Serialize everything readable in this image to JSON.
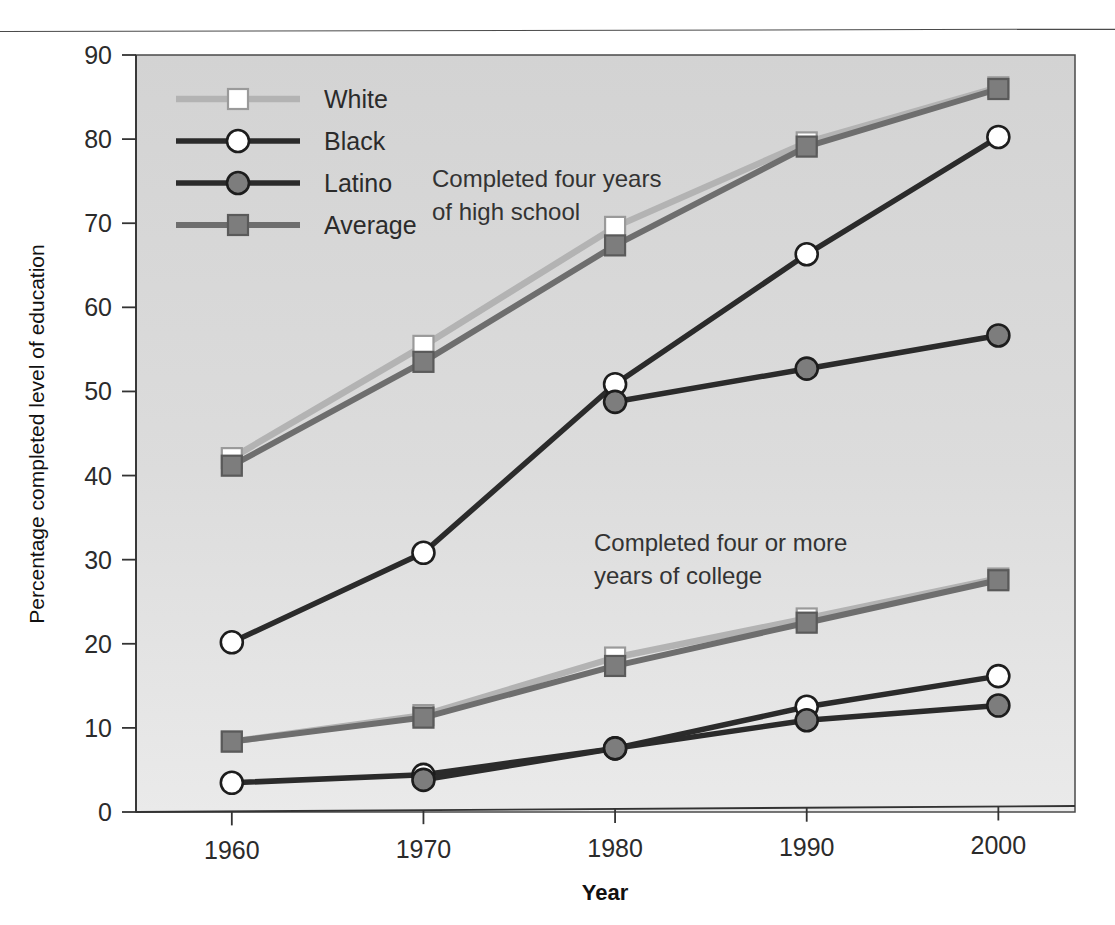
{
  "figure": {
    "has_top_rule": true,
    "plot_background": "#d8d8d8",
    "plot_border_color": "#4a4a4a"
  },
  "colors": {
    "white_series": "#b3b3b3",
    "black_series": "#2b2b2b",
    "latino_series": "#2b2b2b",
    "average_series": "#6e6e6e",
    "white_marker_fill": "#ffffff",
    "black_marker_fill": "#ffffff",
    "latino_marker_fill": "#7d7d7d",
    "average_marker_fill": "#7d7d7d",
    "axis": "#333333",
    "text": "#2b2b2b"
  },
  "legend": {
    "position": "top-left-inside",
    "entries": [
      {
        "label": "White",
        "marker": "open-square",
        "line_color": "#b3b3b3",
        "marker_fill": "#ffffff"
      },
      {
        "label": "Black",
        "marker": "open-circle",
        "line_color": "#2b2b2b",
        "marker_fill": "#ffffff"
      },
      {
        "label": "Latino",
        "marker": "filled-circle",
        "line_color": "#2b2b2b",
        "marker_fill": "#7d7d7d"
      },
      {
        "label": "Average",
        "marker": "filled-square",
        "line_color": "#6e6e6e",
        "marker_fill": "#7d7d7d"
      }
    ]
  },
  "annotations": [
    {
      "id": "high-school",
      "line1": "Completed four years",
      "line2": "of high school"
    },
    {
      "id": "college",
      "line1": "Completed four or more",
      "line2": "years of college"
    }
  ],
  "chart_data": {
    "type": "line",
    "title": "",
    "xlabel": "Year",
    "ylabel": "Percentage completed level of education",
    "x": [
      1960,
      1970,
      1980,
      1990,
      2000
    ],
    "categories": [
      "1960",
      "1970",
      "1980",
      "1990",
      "2000"
    ],
    "xlim": [
      1955,
      2004
    ],
    "ylim": [
      0,
      90
    ],
    "yticks": [
      0,
      10,
      20,
      30,
      40,
      50,
      60,
      70,
      80,
      90
    ],
    "ytick_labels": [
      "0",
      "10",
      "20",
      "30",
      "40",
      "50",
      "60",
      "70",
      "80",
      "90"
    ],
    "grid": false,
    "legend_position": "upper left",
    "groups": [
      {
        "name": "Completed four years of high school",
        "series": [
          {
            "name": "White",
            "values": [
              42.0,
              55.2,
              69.2,
              79.1,
              85.5
            ]
          },
          {
            "name": "Black",
            "values": [
              20.1,
              30.6,
              50.5,
              65.8,
              79.6
            ]
          },
          {
            "name": "Latino",
            "values": [
              null,
              null,
              48.4,
              52.2,
              56.0
            ]
          },
          {
            "name": "Average",
            "values": [
              41.1,
              53.3,
              67.0,
              78.6,
              85.3
            ]
          }
        ]
      },
      {
        "name": "Completed four or more years of college",
        "series": [
          {
            "name": "White",
            "values": [
              8.3,
              11.3,
              18.0,
              22.5,
              27.1
            ]
          },
          {
            "name": "Black",
            "values": [
              3.4,
              4.2,
              7.2,
              12.0,
              15.5
            ]
          },
          {
            "name": "Latino",
            "values": [
              null,
              3.6,
              7.2,
              10.4,
              12.0
            ]
          },
          {
            "name": "Average",
            "values": [
              8.3,
              11.0,
              17.0,
              22.0,
              26.9
            ]
          }
        ]
      }
    ]
  }
}
